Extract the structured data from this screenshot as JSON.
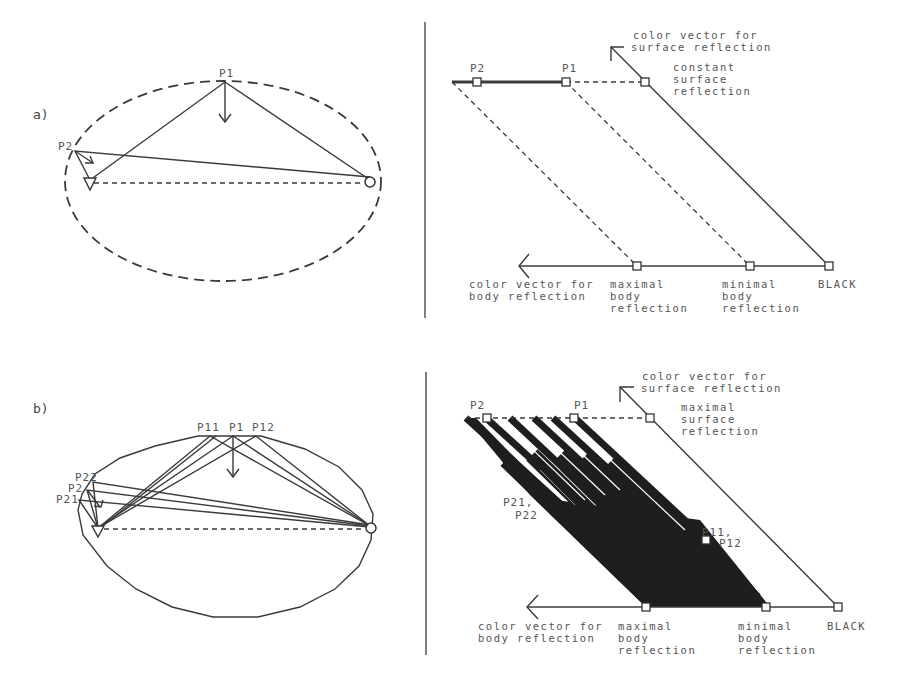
{
  "panels": {
    "a": {
      "label": "a)",
      "left": {
        "points": {
          "p1": "P1",
          "p2": "P2"
        },
        "boundary": "dashed-ellipse"
      },
      "right": {
        "points": {
          "p2": "P2",
          "p1": "P1"
        },
        "surface_vector": {
          "line1": "color vector for",
          "line2": "surface reflection"
        },
        "surface_note": {
          "line1": "constant",
          "line2": "surface",
          "line3": "reflection"
        },
        "body_vector": {
          "line1": "color vector for",
          "line2": "body reflection"
        },
        "max_body": {
          "line1": "maximal",
          "line2": "body",
          "line3": "reflection"
        },
        "min_body": {
          "line1": "minimal",
          "line2": "body",
          "line3": "reflection"
        },
        "black": "BLACK"
      }
    },
    "b": {
      "label": "b)",
      "left": {
        "points": {
          "p11": "P11",
          "p1": "P1",
          "p12": "P12",
          "p22": "P22",
          "p2": "P2",
          "p21": "P21"
        },
        "boundary": "polygon"
      },
      "right": {
        "points": {
          "p2": "P2",
          "p1": "P1",
          "p21_22_a": "P21,",
          "p21_22_b": "P22",
          "p11_12_a": "P11,",
          "p11_12_b": "P12"
        },
        "surface_vector": {
          "line1": "color vector for",
          "line2": "surface reflection"
        },
        "surface_note": {
          "line1": "maximal",
          "line2": "surface",
          "line3": "reflection"
        },
        "body_vector": {
          "line1": "color vector for",
          "line2": "body reflection"
        },
        "max_body": {
          "line1": "maximal",
          "line2": "body",
          "line3": "reflection"
        },
        "min_body": {
          "line1": "minimal",
          "line2": "body",
          "line3": "reflection"
        },
        "black": "BLACK"
      }
    }
  },
  "colors": {
    "ink": "#3a3a3a",
    "text": "#555555",
    "fill": "#1e1e1e",
    "background": "#ffffff"
  }
}
